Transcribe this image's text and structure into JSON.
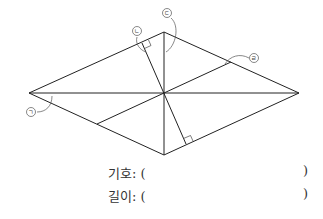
{
  "diagram": {
    "shape": "rhombus",
    "vertices": {
      "left": [
        29,
        93
      ],
      "top": [
        164,
        32
      ],
      "right": [
        299,
        93
      ],
      "bottom": [
        164,
        155
      ]
    },
    "center": [
      164,
      93
    ],
    "lines": [
      {
        "name": "horizontal-diagonal",
        "from": [
          29,
          93
        ],
        "to": [
          299,
          93
        ]
      },
      {
        "name": "vertical-diagonal",
        "from": [
          164,
          32
        ],
        "to": [
          164,
          155
        ]
      },
      {
        "name": "perpendicular-height",
        "from": [
          142,
          43
        ],
        "to": [
          186,
          144
        ]
      },
      {
        "name": "parallel-segment",
        "from": [
          97,
          124
        ],
        "to": [
          231,
          62
        ]
      }
    ],
    "markers": [
      {
        "symbol": "㉠",
        "label": "ㄱ",
        "pos": [
          30,
          111
        ]
      },
      {
        "symbol": "㉡",
        "label": "ㄴ",
        "pos": [
          137,
          31
        ]
      },
      {
        "symbol": "㉢",
        "label": "ㄷ",
        "pos": [
          165,
          12
        ]
      },
      {
        "symbol": "㉣",
        "label": "ㄹ",
        "pos": [
          253,
          58
        ]
      }
    ],
    "line_color": "#222222"
  },
  "answers": {
    "symbol_label": "기호: (",
    "symbol_close": ")",
    "length_label": "길이: (",
    "length_close": ")"
  }
}
